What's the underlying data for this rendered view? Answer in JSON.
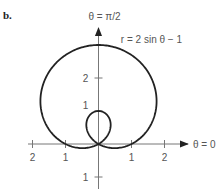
{
  "panel_label": "b.",
  "chart_data": {
    "type": "line",
    "subtype": "polar",
    "title": "",
    "equation_label": "r = 2 sin θ − 1",
    "axis_labels": {
      "polar_axis": "θ = 0",
      "vertical_axis": "θ = π/2"
    },
    "x_ticks": [
      -2,
      -1,
      1,
      2
    ],
    "x_tick_labels": [
      "2",
      "1",
      "1",
      "2"
    ],
    "y_ticks": [
      -1,
      1,
      2
    ],
    "y_tick_labels": [
      "1",
      "1",
      "2"
    ],
    "xlim": [
      -2.1,
      2.9
    ],
    "ylim": [
      -1.3,
      3.6
    ],
    "grid": false,
    "series": [
      {
        "name": "r = 2 sin θ − 1",
        "theta_range": [
          0,
          6.2832
        ],
        "description": "Limaçon with inner loop; outer loop reaches (0,3), inner loop reaches (0,1), crosses x-axis at ±1",
        "key_points": [
          {
            "x": 0,
            "y": 3
          },
          {
            "x": 0,
            "y": 1
          },
          {
            "x": 1,
            "y": 0
          },
          {
            "x": -1,
            "y": 0
          },
          {
            "x": 0,
            "y": 0
          }
        ]
      }
    ],
    "colors": {
      "curve": "#222222",
      "axes": "#777777",
      "text": "#555555"
    }
  }
}
